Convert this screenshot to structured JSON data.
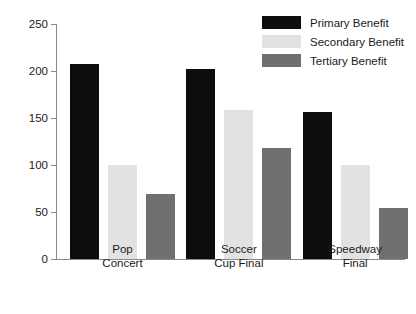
{
  "chart_data": {
    "type": "bar",
    "title": "",
    "subtitle": "",
    "xlabel": "",
    "ylabel": "Per capita (£)",
    "categories": [
      "Pop\nConcert",
      "Soccer\nCup Final",
      "Speedway\nFinal"
    ],
    "category_lines": [
      [
        "Pop",
        "Concert"
      ],
      [
        "Soccer",
        "Cup Final"
      ],
      [
        "Speedway",
        "Final"
      ]
    ],
    "series": [
      {
        "name": "Primary Benefit",
        "color": "#0d0d0d",
        "values": [
          207,
          202,
          156
        ]
      },
      {
        "name": "Secondary Benefit",
        "color": "#e2e2e2",
        "values": [
          100,
          158,
          100
        ]
      },
      {
        "name": "Tertiary Benefit",
        "color": "#707070",
        "values": [
          69,
          118,
          54
        ]
      }
    ],
    "ylim": [
      0,
      250
    ],
    "yticks": [
      0,
      50,
      100,
      150,
      200,
      250
    ],
    "ytick_labels": [
      "0",
      "50",
      "100",
      "150",
      "200",
      "250"
    ],
    "grid": false,
    "legend_position": "top-right",
    "axis_color": "#8a8a8a",
    "text_color": "#1b1b1b",
    "background": "#ffffff"
  },
  "legend": {
    "entries": [
      {
        "label": "Primary Benefit",
        "color": "#0d0d0d"
      },
      {
        "label": "Secondary Benefit",
        "color": "#e2e2e2"
      },
      {
        "label": "Tertiary Benefit",
        "color": "#707070"
      }
    ]
  }
}
